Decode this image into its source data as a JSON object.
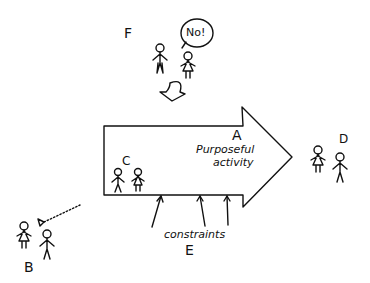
{
  "diagram": {
    "labels": {
      "A": "A",
      "B": "B",
      "C": "C",
      "D": "D",
      "E": "E",
      "F": "F"
    },
    "arrow_text_line1": "Purposeful",
    "arrow_text_line2": "activity",
    "constraints_text": "constraints",
    "speech_bubble_text": "No!",
    "colors": {
      "ink": "#111111",
      "background": "#ffffff"
    }
  }
}
